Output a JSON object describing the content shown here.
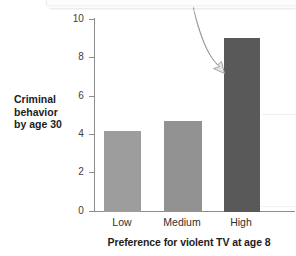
{
  "chart_data": {
    "type": "bar",
    "title": "",
    "xlabel": "Preference for violent TV at age 8",
    "ylabel": "Criminal behavior by age 30",
    "ylabel_lines": [
      "Criminal",
      "behavior",
      "by age 30"
    ],
    "categories": [
      "Low",
      "Medium",
      "High"
    ],
    "values": [
      4.2,
      4.75,
      9.05
    ],
    "ylim": [
      0,
      10
    ],
    "yticks": [
      0,
      2,
      4,
      6,
      8,
      10
    ],
    "ytick_labels": [
      "0",
      "2",
      "4",
      "6",
      "8",
      "10"
    ],
    "grid": false,
    "legend": null,
    "bar_colors": [
      "#9d9d9d",
      "#929292",
      "#595959"
    ],
    "axis_color": "#8d8d8d",
    "annotations": [
      {
        "name": "curved-arrow",
        "points_to": "High",
        "color": "#e4e4e4",
        "outline": "#9a9a9a"
      }
    ]
  }
}
